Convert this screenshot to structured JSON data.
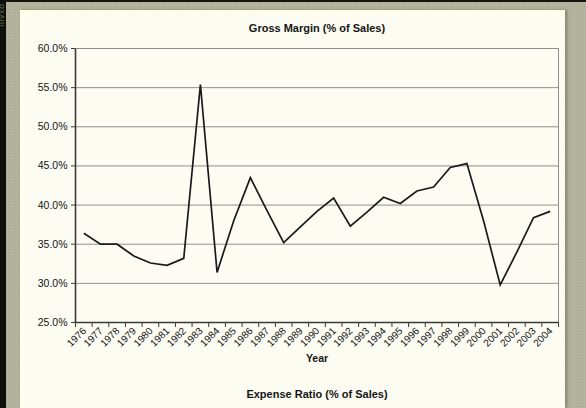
{
  "page": {
    "spine_text": "OXAIII"
  },
  "chart_data": {
    "type": "line",
    "title": "Gross Margin (% of Sales)",
    "xlabel": "Year",
    "ylabel": "",
    "ylim": [
      25,
      60
    ],
    "ytick_step": 5,
    "ytick_labels": [
      "25.0%",
      "30.0%",
      "35.0%",
      "40.0%",
      "45.0%",
      "50.0%",
      "55.0%",
      "60.0%"
    ],
    "grid": true,
    "legend": "none",
    "categories": [
      "1976",
      "1977",
      "1978",
      "1979",
      "1980",
      "1981",
      "1982",
      "1983",
      "1984",
      "1985",
      "1986",
      "1987",
      "1988",
      "1989",
      "1990",
      "1991",
      "1992",
      "1993",
      "1994",
      "1995",
      "1996",
      "1997",
      "1998",
      "1999",
      "2000",
      "2001",
      "2002",
      "2003",
      "2004"
    ],
    "values": [
      36.4,
      35.0,
      35.0,
      33.5,
      32.6,
      32.3,
      33.2,
      55.4,
      31.4,
      38.0,
      43.5,
      39.3,
      35.2,
      37.2,
      39.2,
      40.9,
      37.3,
      39.1,
      41.0,
      40.2,
      41.8,
      42.3,
      44.8,
      45.3,
      38.0,
      29.8,
      34.0,
      38.4,
      39.2
    ]
  },
  "next_chart": {
    "title": "Expense Ratio (% of Sales)"
  },
  "colors": {
    "background_olive": "#b3b29c",
    "page": "#fcfcf3",
    "spine": "#0e0e0c",
    "spine_text": "#7d8f5e",
    "gridline": "#8f8f8f",
    "axis": "#3a3a3a",
    "series": "#1a1a1a",
    "tick_label": "#141414"
  }
}
